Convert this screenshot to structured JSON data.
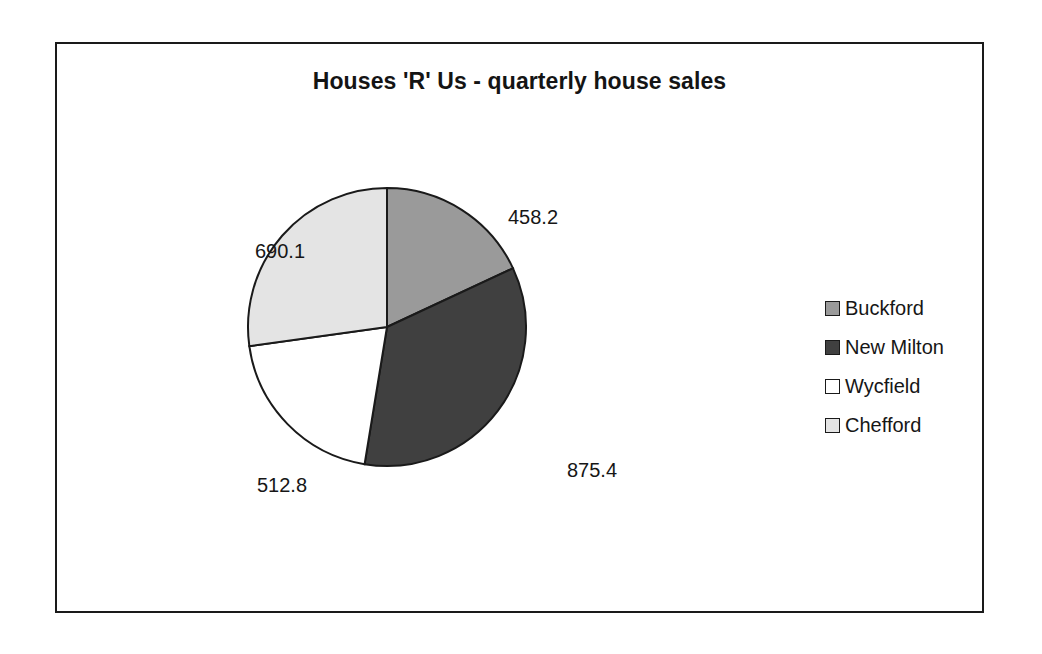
{
  "chart_data": {
    "type": "pie",
    "title": "Houses 'R' Us - quarterly house sales",
    "categories": [
      "Buckford",
      "New Milton",
      "Wycfield",
      "Chefford"
    ],
    "values": [
      458.2,
      875.4,
      512.8,
      690.1
    ],
    "labels": [
      "458.2",
      "875.4",
      "512.8",
      "690.1"
    ],
    "total": 2536.5,
    "start_angle_deg": 0,
    "direction": "clockwise",
    "slice_angles_deg": [
      65.0,
      124.3,
      72.8,
      97.9
    ],
    "colors": [
      "#9a9a9a",
      "#404040",
      "#ffffff",
      "#e4e4e4"
    ],
    "legend_position": "right",
    "grid": false,
    "xlabel": "",
    "ylabel": "",
    "series": [
      {
        "name": "Buckford",
        "value": 458.2,
        "color": "#9a9a9a"
      },
      {
        "name": "New Milton",
        "value": 875.4,
        "color": "#404040"
      },
      {
        "name": "Wycfield",
        "value": 512.8,
        "color": "#ffffff"
      },
      {
        "name": "Chefford",
        "value": 690.1,
        "color": "#e4e4e4"
      }
    ]
  },
  "frame": {
    "border_color": "#1a1a1a",
    "background": "#ffffff"
  },
  "legend": {
    "items": [
      {
        "label": "Buckford",
        "color": "#9a9a9a"
      },
      {
        "label": "New Milton",
        "color": "#404040"
      },
      {
        "label": "Wycfield",
        "color": "#ffffff"
      },
      {
        "label": "Chefford",
        "color": "#e4e4e4"
      }
    ]
  }
}
